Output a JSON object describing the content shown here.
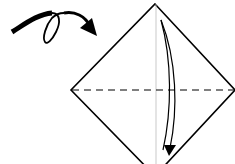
{
  "diagram": {
    "type": "origami-step",
    "instruction_symbols": [
      {
        "name": "turn-over-arrow",
        "meaning": "turn paper over"
      },
      {
        "name": "valley-fold-line",
        "style": "dashed",
        "orientation": "horizontal"
      },
      {
        "name": "fold-down-arrow",
        "direction": "top-to-bottom"
      }
    ],
    "shape": "square-diamond",
    "colors": {
      "stroke": "#000000",
      "guide": "#bbbbbb",
      "background": "#ffffff"
    }
  }
}
